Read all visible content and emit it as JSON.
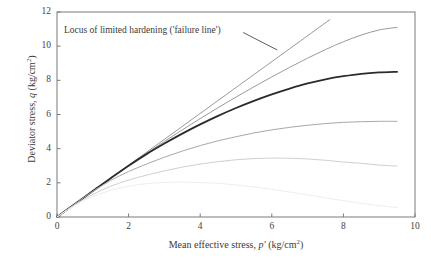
{
  "chart_data": {
    "type": "line",
    "title": "",
    "subtitle": "",
    "xlabel_parts": {
      "prefix": "Mean effective stress, ",
      "symbol": "p′",
      "units": " (kg/cm",
      "exponent": "2",
      "suffix": ")"
    },
    "ylabel_parts": {
      "prefix": "Deviator stress, ",
      "symbol": "q",
      "units": " (kg/cm",
      "exponent": "2",
      "suffix": ")"
    },
    "xlabel": "Mean effective stress, p′ (kg/cm2)",
    "ylabel": "Deviator stress, q (kg/cm2)",
    "xlim": [
      0,
      10
    ],
    "ylim": [
      0,
      12
    ],
    "xticks": [
      0,
      2,
      4,
      6,
      8,
      10
    ],
    "yticks": [
      0,
      2,
      4,
      6,
      8,
      10,
      12
    ],
    "xtick_labels": [
      "0",
      "2",
      "4",
      "6",
      "8",
      "10"
    ],
    "ytick_labels": [
      "0",
      "2",
      "4",
      "6",
      "8",
      "10",
      "12"
    ],
    "grid": false,
    "legend": "none",
    "annotations": [
      {
        "name": "failure-line-annotation",
        "text": "Locus of limited hardening ('failure line')",
        "leader_from": [
          5.2,
          10.8
        ],
        "leader_to": [
          6.15,
          9.78
        ]
      }
    ],
    "series": [
      {
        "name": "failure-line",
        "label": "Locus of limited hardening ('failure line')",
        "color": "#9a9a9a",
        "width": 1.0,
        "points": [
          [
            0,
            0
          ],
          [
            7.62,
            11.55
          ]
        ]
      },
      {
        "name": "hardening-curve-1",
        "label": "Hardening curve 1 (highest)",
        "color": "#9a9a9a",
        "width": 1.0,
        "points": [
          [
            0,
            0
          ],
          [
            0.5,
            0.76
          ],
          [
            1.0,
            1.52
          ],
          [
            1.5,
            2.27
          ],
          [
            2.0,
            3.0
          ],
          [
            2.5,
            3.72
          ],
          [
            3.0,
            4.42
          ],
          [
            3.5,
            5.1
          ],
          [
            4.0,
            5.76
          ],
          [
            4.5,
            6.4
          ],
          [
            5.0,
            7.02
          ],
          [
            5.5,
            7.62
          ],
          [
            6.0,
            8.2
          ],
          [
            6.5,
            8.76
          ],
          [
            7.0,
            9.3
          ],
          [
            7.5,
            9.8
          ],
          [
            8.0,
            10.26
          ],
          [
            8.5,
            10.65
          ],
          [
            9.0,
            10.95
          ],
          [
            9.5,
            11.1
          ]
        ]
      },
      {
        "name": "hardening-curve-2-bold",
        "label": "Hardening curve 2 (bold, emphasised)",
        "color": "#2b2b2b",
        "width": 1.8,
        "points": [
          [
            0,
            0
          ],
          [
            0.5,
            0.76
          ],
          [
            1.0,
            1.52
          ],
          [
            1.5,
            2.27
          ],
          [
            2.0,
            3.0
          ],
          [
            2.5,
            3.68
          ],
          [
            3.0,
            4.3
          ],
          [
            3.5,
            4.88
          ],
          [
            4.0,
            5.42
          ],
          [
            4.5,
            5.92
          ],
          [
            5.0,
            6.38
          ],
          [
            5.5,
            6.8
          ],
          [
            6.0,
            7.18
          ],
          [
            6.5,
            7.52
          ],
          [
            7.0,
            7.82
          ],
          [
            7.5,
            8.06
          ],
          [
            8.0,
            8.24
          ],
          [
            8.5,
            8.38
          ],
          [
            9.0,
            8.46
          ],
          [
            9.5,
            8.5
          ]
        ]
      },
      {
        "name": "hardening-curve-3",
        "label": "Hardening curve 3",
        "color": "#a8a8a8",
        "width": 1.0,
        "points": [
          [
            0,
            0
          ],
          [
            0.5,
            0.76
          ],
          [
            1.0,
            1.5
          ],
          [
            1.5,
            2.14
          ],
          [
            2.0,
            2.66
          ],
          [
            2.5,
            3.1
          ],
          [
            3.0,
            3.5
          ],
          [
            3.5,
            3.86
          ],
          [
            4.0,
            4.18
          ],
          [
            4.5,
            4.46
          ],
          [
            5.0,
            4.7
          ],
          [
            5.5,
            4.92
          ],
          [
            6.0,
            5.1
          ],
          [
            6.5,
            5.25
          ],
          [
            7.0,
            5.37
          ],
          [
            7.5,
            5.47
          ],
          [
            8.0,
            5.54
          ],
          [
            8.5,
            5.58
          ],
          [
            9.0,
            5.6
          ],
          [
            9.5,
            5.6
          ]
        ]
      },
      {
        "name": "hardening-curve-4",
        "label": "Hardening curve 4 (peaks then softens)",
        "color": "#d0d0d0",
        "width": 1.0,
        "points": [
          [
            0,
            0
          ],
          [
            0.5,
            0.72
          ],
          [
            1.0,
            1.32
          ],
          [
            1.5,
            1.8
          ],
          [
            2.0,
            2.16
          ],
          [
            2.5,
            2.45
          ],
          [
            3.0,
            2.7
          ],
          [
            3.5,
            2.92
          ],
          [
            4.0,
            3.1
          ],
          [
            4.5,
            3.24
          ],
          [
            5.0,
            3.35
          ],
          [
            5.5,
            3.42
          ],
          [
            6.0,
            3.45
          ],
          [
            6.5,
            3.44
          ],
          [
            7.0,
            3.4
          ],
          [
            7.5,
            3.32
          ],
          [
            8.0,
            3.22
          ],
          [
            8.5,
            3.14
          ],
          [
            9.0,
            3.04
          ],
          [
            9.5,
            2.98
          ]
        ]
      },
      {
        "name": "hardening-curve-5-faint",
        "label": "Hardening curve 5 (faintest, softens to low q)",
        "color": "#eeeeee",
        "width": 1.0,
        "points": [
          [
            0,
            0
          ],
          [
            0.5,
            0.68
          ],
          [
            1.0,
            1.2
          ],
          [
            1.5,
            1.56
          ],
          [
            2.0,
            1.8
          ],
          [
            2.5,
            1.95
          ],
          [
            3.0,
            2.02
          ],
          [
            3.5,
            2.04
          ],
          [
            4.0,
            2.02
          ],
          [
            4.5,
            1.97
          ],
          [
            5.0,
            1.88
          ],
          [
            5.5,
            1.76
          ],
          [
            6.0,
            1.62
          ],
          [
            6.5,
            1.46
          ],
          [
            7.0,
            1.3
          ],
          [
            7.5,
            1.12
          ],
          [
            8.0,
            0.96
          ],
          [
            8.5,
            0.8
          ],
          [
            9.0,
            0.66
          ],
          [
            9.5,
            0.56
          ]
        ]
      }
    ],
    "colors": {
      "frame": "#7a7a7a",
      "text": "#3a3a3a",
      "bold_curve": "#2b2b2b",
      "background": "#ffffff"
    }
  }
}
